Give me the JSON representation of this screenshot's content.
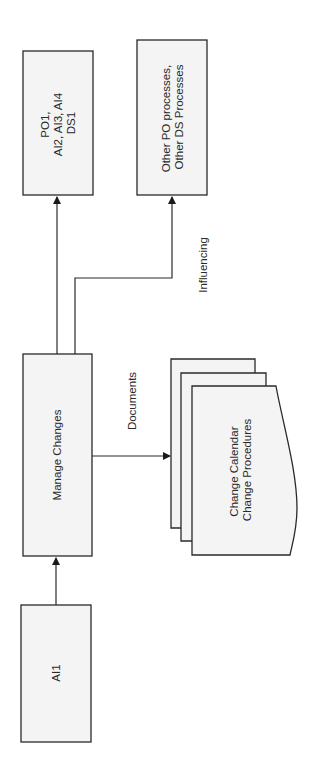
{
  "diagram": {
    "orientation": "rotated-90-ccw",
    "nodes": {
      "ai1": {
        "label": "AI1"
      },
      "manage_changes": {
        "label": "Manage Changes"
      },
      "po1_group": {
        "lines": [
          "PO1,",
          "AI2, AI3, AI4",
          "DS1"
        ]
      },
      "other_processes": {
        "lines": [
          "Other PO processes,",
          "Other DS Processes"
        ]
      },
      "documents": {
        "lines": [
          "Change Calendar",
          "Change Procedures"
        ]
      }
    },
    "edges": {
      "ai1_to_manage": {
        "label": ""
      },
      "manage_to_po1": {
        "label": ""
      },
      "manage_to_other": {
        "label": "Influencing"
      },
      "manage_to_docs": {
        "label": "Documents"
      }
    },
    "colors": {
      "stroke": "#2a2a2a",
      "fill": "#f4f4f4",
      "background": "#ffffff"
    }
  }
}
